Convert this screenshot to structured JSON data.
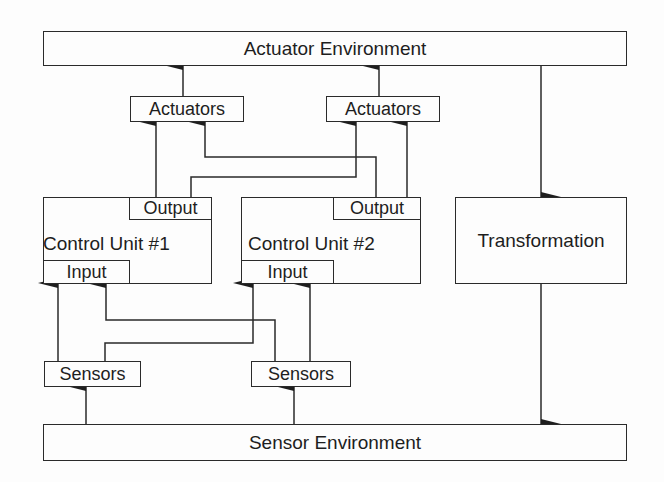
{
  "diagram": {
    "actuator_environment": {
      "label": "Actuator Environment"
    },
    "sensor_environment": {
      "label": "Sensor Environment"
    },
    "transformation": {
      "label": "Transformation"
    },
    "actuators": [
      {
        "label": "Actuators"
      },
      {
        "label": "Actuators"
      }
    ],
    "sensors": [
      {
        "label": "Sensors"
      },
      {
        "label": "Sensors"
      }
    ],
    "control_units": [
      {
        "label": "Control Unit #1",
        "output_label": "Output",
        "input_label": "Input"
      },
      {
        "label": "Control Unit #2",
        "output_label": "Output",
        "input_label": "Input"
      }
    ],
    "edges": [
      {
        "from": "Actuators (1)",
        "to": "Actuator Environment"
      },
      {
        "from": "Actuators (2)",
        "to": "Actuator Environment"
      },
      {
        "from": "Control Unit #1 Output",
        "to": "Actuators (1)"
      },
      {
        "from": "Control Unit #1 Output",
        "to": "Actuators (2)"
      },
      {
        "from": "Control Unit #2 Output",
        "to": "Actuators (1)"
      },
      {
        "from": "Control Unit #2 Output",
        "to": "Actuators (2)"
      },
      {
        "from": "Actuator Environment",
        "to": "Transformation"
      },
      {
        "from": "Transformation",
        "to": "Sensor Environment"
      },
      {
        "from": "Sensor Environment",
        "to": "Sensors (1)"
      },
      {
        "from": "Sensor Environment",
        "to": "Sensors (2)"
      },
      {
        "from": "Sensors (1)",
        "to": "Control Unit #1 Input"
      },
      {
        "from": "Sensors (1)",
        "to": "Control Unit #2 Input"
      },
      {
        "from": "Sensors (2)",
        "to": "Control Unit #1 Input"
      },
      {
        "from": "Sensors (2)",
        "to": "Control Unit #2 Input"
      }
    ]
  },
  "colors": {
    "line": "#2a2a2a",
    "background": "#fdfdfd",
    "text": "#1e1e1e"
  }
}
